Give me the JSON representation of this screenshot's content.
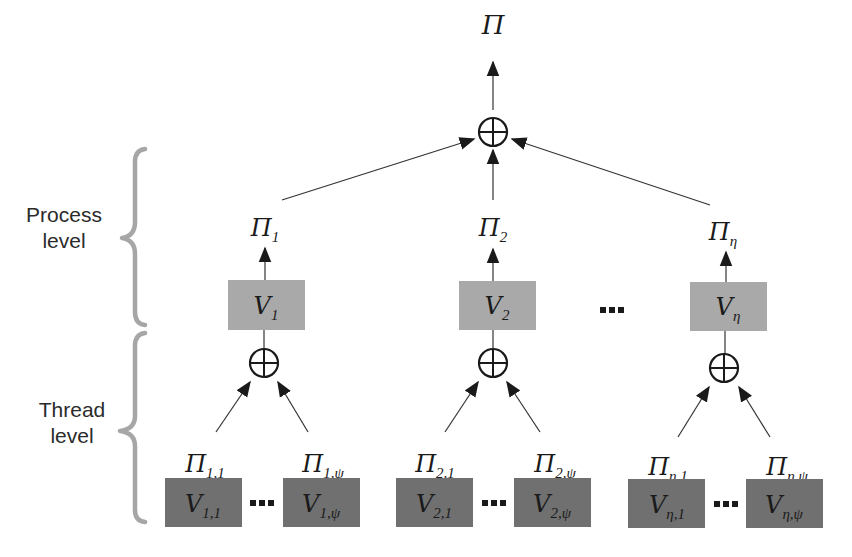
{
  "diagram": {
    "colors": {
      "process_box": "#a9a9a9",
      "thread_box": "#707070",
      "brace": "#a6a6a6",
      "line": "#333333"
    },
    "levels": {
      "process": {
        "line1": "Process",
        "line2": "level"
      },
      "thread": {
        "line1": "Thread",
        "line2": "level"
      }
    },
    "root": {
      "symbol": "Π",
      "sub": ""
    },
    "operator_symbol": "⊕",
    "ellipsis": "…",
    "processes": [
      {
        "result": {
          "symbol": "Π",
          "sub": "1"
        },
        "box": {
          "symbol": "V",
          "sub": "1"
        },
        "threads": [
          {
            "result": {
              "symbol": "Π",
              "sub": "1,1"
            },
            "box": {
              "symbol": "V",
              "sub": "1,1"
            }
          },
          {
            "result": {
              "symbol": "Π",
              "sub": "1,ψ"
            },
            "box": {
              "symbol": "V",
              "sub": "1,ψ"
            }
          }
        ]
      },
      {
        "result": {
          "symbol": "Π",
          "sub": "2"
        },
        "box": {
          "symbol": "V",
          "sub": "2"
        },
        "threads": [
          {
            "result": {
              "symbol": "Π",
              "sub": "2,1"
            },
            "box": {
              "symbol": "V",
              "sub": "2,1"
            }
          },
          {
            "result": {
              "symbol": "Π",
              "sub": "2,ψ"
            },
            "box": {
              "symbol": "V",
              "sub": "2,ψ"
            }
          }
        ]
      },
      {
        "result": {
          "symbol": "Π",
          "sub": "η"
        },
        "box": {
          "symbol": "V",
          "sub": "η"
        },
        "threads": [
          {
            "result": {
              "symbol": "Π",
              "sub": "η,1"
            },
            "box": {
              "symbol": "V",
              "sub": "η,1"
            }
          },
          {
            "result": {
              "symbol": "Π",
              "sub": "η,ψ"
            },
            "box": {
              "symbol": "V",
              "sub": "η,ψ"
            }
          }
        ]
      }
    ]
  }
}
